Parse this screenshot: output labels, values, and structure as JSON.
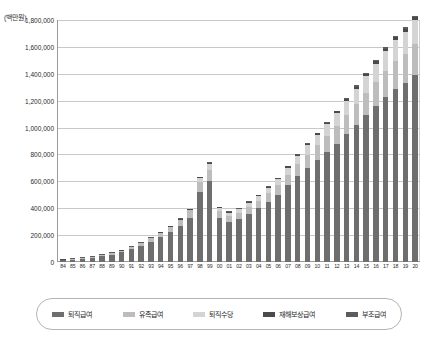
{
  "chart_data": {
    "type": "bar",
    "stacked": true,
    "title": "",
    "subtitle": "",
    "unit_label": "(백만원)",
    "xlabel": "",
    "ylabel": "",
    "ylim": [
      0,
      1800000
    ],
    "ytick_step": 200000,
    "ytick_labels": [
      "1,800,000",
      "1,600,000",
      "1,400,000",
      "1,200,000",
      "1,000,000",
      "800,000",
      "600,000",
      "400,000",
      "200,000",
      "0"
    ],
    "ytick_values": [
      1800000,
      1600000,
      1400000,
      1200000,
      1000000,
      800000,
      600000,
      400000,
      200000,
      0
    ],
    "grid": true,
    "grid_axis": "y",
    "legend_position": "bottom",
    "categories": [
      "84",
      "85",
      "86",
      "87",
      "88",
      "89",
      "90",
      "91",
      "92",
      "93",
      "94",
      "95",
      "96",
      "97",
      "98",
      "99",
      "00",
      "01",
      "02",
      "03",
      "04",
      "05",
      "06",
      "07",
      "08",
      "09",
      "10",
      "11",
      "12",
      "13",
      "14",
      "15",
      "16",
      "17",
      "18",
      "19",
      "20"
    ],
    "series": [
      {
        "name": "퇴직급여",
        "color": "#6e6e6e",
        "values": [
          14000,
          18000,
          23000,
          30000,
          43000,
          55000,
          72000,
          95000,
          120000,
          150000,
          185000,
          225000,
          270000,
          330000,
          520000,
          600000,
          330000,
          300000,
          320000,
          360000,
          400000,
          450000,
          500000,
          570000,
          640000,
          700000,
          760000,
          820000,
          880000,
          950000,
          1020000,
          1090000,
          1160000,
          1230000,
          1290000,
          1330000,
          1390000
        ]
      },
      {
        "name": "유족급여",
        "color": "#bdbdbd",
        "values": [
          3000,
          4000,
          5000,
          6000,
          8000,
          10000,
          13000,
          16000,
          20000,
          25000,
          31000,
          38000,
          46000,
          56000,
          72000,
          85000,
          46000,
          42000,
          45000,
          50000,
          56000,
          62000,
          70000,
          79000,
          88000,
          98000,
          108000,
          118000,
          129000,
          140000,
          152000,
          164000,
          177000,
          190000,
          203000,
          216000,
          230000
        ]
      },
      {
        "name": "퇴직수당",
        "color": "#d4d4d4",
        "values": [
          0,
          0,
          0,
          0,
          0,
          0,
          0,
          0,
          0,
          0,
          0,
          0,
          0,
          0,
          30000,
          45000,
          28000,
          26000,
          28000,
          32000,
          36000,
          41000,
          47000,
          54000,
          62000,
          70000,
          79000,
          88000,
          98000,
          108000,
          118000,
          128000,
          138000,
          148000,
          158000,
          168000,
          178000
        ]
      },
      {
        "name": "재해보상급여",
        "color": "#4a4a4a",
        "values": [
          300,
          400,
          500,
          600,
          800,
          1000,
          1200,
          1500,
          1900,
          2400,
          3000,
          3700,
          4500,
          5500,
          7000,
          8500,
          4500,
          4200,
          4500,
          5000,
          5600,
          6200,
          7000,
          7900,
          8800,
          9800,
          10800,
          11800,
          12900,
          14000,
          15200,
          16400,
          17700,
          19000,
          20300,
          21600,
          23000
        ]
      },
      {
        "name": "부조급여",
        "color": "#5c5c5c",
        "values": [
          200,
          250,
          300,
          350,
          450,
          550,
          700,
          850,
          1050,
          1300,
          1600,
          2000,
          2400,
          2900,
          3700,
          4500,
          2400,
          2200,
          2400,
          2700,
          3000,
          3300,
          3700,
          4200,
          4700,
          5200,
          5700,
          6300,
          6900,
          7500,
          8100,
          8800,
          9500,
          10200,
          10900,
          11600,
          12300
        ]
      }
    ],
    "totals": [
      17500,
      22650,
      28800,
      36950,
      52250,
      66550,
      86900,
      113350,
      142950,
      178700,
      220600,
      268700,
      322900,
      394400,
      632700,
      743000,
      410900,
      374400,
      399900,
      449700,
      500600,
      562500,
      627700,
      715100,
      803500,
      883000,
      963500,
      1044100,
      1126800,
      1219500,
      1313300,
      1408200,
      1502200,
      1601200,
      1683200,
      1747200,
      1833300
    ],
    "note_series_order_bottom_to_top": [
      "퇴직급여",
      "유족급여",
      "퇴직수당",
      "재해보상급여",
      "부조급여"
    ]
  },
  "legend": {
    "items": [
      {
        "label": "퇴직급여",
        "color": "#6e6e6e"
      },
      {
        "label": "유족급여",
        "color": "#bdbdbd"
      },
      {
        "label": "퇴직수당",
        "color": "#d4d4d4"
      },
      {
        "label": "재해보상급여",
        "color": "#4a4a4a"
      },
      {
        "label": "부조급여",
        "color": "#5c5c5c"
      }
    ]
  }
}
